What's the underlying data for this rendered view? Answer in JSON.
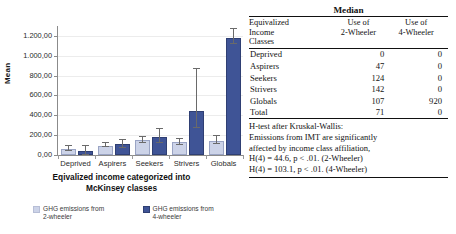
{
  "chart_data": {
    "type": "bar",
    "title": "",
    "xlabel": "Eqivalized income categorized into McKinsey classes",
    "ylabel": "Mean",
    "categories": [
      "Deprived",
      "Aspirers",
      "Seekers",
      "Strivers",
      "Globals"
    ],
    "ylim": [
      0,
      1300
    ],
    "yticks": [
      0,
      200,
      400,
      600,
      800,
      1000,
      1200
    ],
    "ytick_labels": [
      "0,00",
      "200,00",
      "400,00",
      "600,00",
      "800,00",
      "1.000,00",
      "1.200,00"
    ],
    "grid": true,
    "legend_position": "bottom",
    "series": [
      {
        "name": "GHG emissions from 2-wheeler",
        "color": "#ccd3e8",
        "values": [
          62,
          95,
          152,
          130,
          145
        ],
        "error_low": [
          40,
          78,
          125,
          100,
          108
        ],
        "error_high": [
          88,
          118,
          182,
          162,
          190
        ]
      },
      {
        "name": "GHG emissions from 4-wheeler",
        "color": "#3f5496",
        "values": [
          38,
          110,
          185,
          440,
          1180
        ],
        "error_low": [
          2,
          72,
          120,
          270,
          1115
        ],
        "error_high": [
          92,
          155,
          262,
          862,
          1265
        ]
      }
    ]
  },
  "chart": {
    "y_axis_title": "Mean",
    "x_axis_title_line1": "Eqivalized income categorized into",
    "x_axis_title_line2": "McKinsey classes",
    "legend": [
      {
        "label_line1": "GHG emissions from",
        "label_line2": "2-wheeler",
        "swatch": "s1"
      },
      {
        "label_line1": "GHG emissions from",
        "label_line2": "4-wheeler",
        "swatch": "s2"
      }
    ]
  },
  "table": {
    "title": "Median",
    "headers": {
      "row_label_line1": "Equivalized",
      "row_label_line2": "Income",
      "row_label_line3": "Classes",
      "col1_line1": "Use of",
      "col1_line2": "2-Wheeler",
      "col2_line1": "Use of",
      "col2_line2": "4-Wheeler"
    },
    "rows": [
      {
        "label": "Deprived",
        "two_wheeler": "0",
        "four_wheeler": "0"
      },
      {
        "label": "Aspirers",
        "two_wheeler": "47",
        "four_wheeler": "0"
      },
      {
        "label": "Seekers",
        "two_wheeler": "124",
        "four_wheeler": "0"
      },
      {
        "label": "Strivers",
        "two_wheeler": "142",
        "four_wheeler": "0"
      },
      {
        "label": "Globals",
        "two_wheeler": "107",
        "four_wheeler": "920"
      },
      {
        "label": "Total",
        "two_wheeler": "71",
        "four_wheeler": "0"
      }
    ],
    "htest": {
      "line1": "H-test after Kruskal-Wallis:",
      "line2": "Emissions from IMT are significantly",
      "line3": "affected by income class affiliation,",
      "line4": "H(4) = 44.6, p < .01. (2-Wheeler)",
      "line5": "H(4) = 103.1, p < .01. (4-Wheeler)"
    }
  },
  "colors": {
    "series_2wheeler": "#ccd3e8",
    "series_4wheeler": "#3f5496",
    "axis": "#8b8b8b",
    "grid": "#ececec"
  }
}
